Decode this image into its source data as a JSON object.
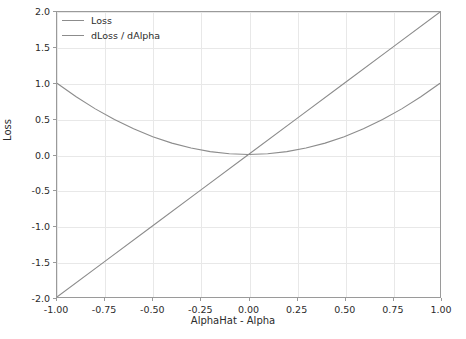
{
  "chart_data": {
    "type": "line",
    "title": "",
    "xlabel": "AlphaHat - Alpha",
    "ylabel": "Loss",
    "xlim": [
      -1.0,
      1.0
    ],
    "ylim": [
      -2.0,
      2.0
    ],
    "grid": true,
    "legend_position": "upper left",
    "xticks": [
      -1.0,
      -0.75,
      -0.5,
      -0.25,
      0.0,
      0.25,
      0.5,
      0.75,
      1.0
    ],
    "xticklabels": [
      "-1.00",
      "-0.75",
      "-0.50",
      "-0.25",
      "0.00",
      "0.25",
      "0.50",
      "0.75",
      "1.00"
    ],
    "yticks": [
      -2.0,
      -1.5,
      -1.0,
      -0.5,
      0.0,
      0.5,
      1.0,
      1.5,
      2.0
    ],
    "yticklabels": [
      "-2.0",
      "-1.5",
      "-1.0",
      "-0.5",
      "0.0",
      "0.5",
      "1.0",
      "1.5",
      "2.0"
    ],
    "series": [
      {
        "name": "Loss",
        "color": "#8c8c8c",
        "x": [
          -1.0,
          -0.9,
          -0.8,
          -0.7,
          -0.6,
          -0.5,
          -0.4,
          -0.3,
          -0.2,
          -0.1,
          0.0,
          0.1,
          0.2,
          0.3,
          0.4,
          0.5,
          0.6,
          0.7,
          0.8,
          0.9,
          1.0
        ],
        "values": [
          1.0,
          0.81,
          0.64,
          0.49,
          0.36,
          0.25,
          0.16,
          0.09,
          0.04,
          0.01,
          0.0,
          0.01,
          0.04,
          0.09,
          0.16,
          0.25,
          0.36,
          0.49,
          0.64,
          0.81,
          1.0
        ]
      },
      {
        "name": "dLoss / dAlpha",
        "color": "#8c8c8c",
        "x": [
          -1.0,
          -0.75,
          -0.5,
          -0.25,
          0.0,
          0.25,
          0.5,
          0.75,
          1.0
        ],
        "values": [
          -2.0,
          -1.5,
          -1.0,
          -0.5,
          0.0,
          0.5,
          1.0,
          1.5,
          2.0
        ]
      }
    ]
  },
  "legend": {
    "entries": [
      {
        "label": "Loss"
      },
      {
        "label": "dLoss / dAlpha"
      }
    ]
  },
  "colors": {
    "background": "#ffffff",
    "grid": "#e8e8e8",
    "axis": "#9a9a9a",
    "text": "#2b2b2b",
    "line": "#8c8c8c"
  }
}
